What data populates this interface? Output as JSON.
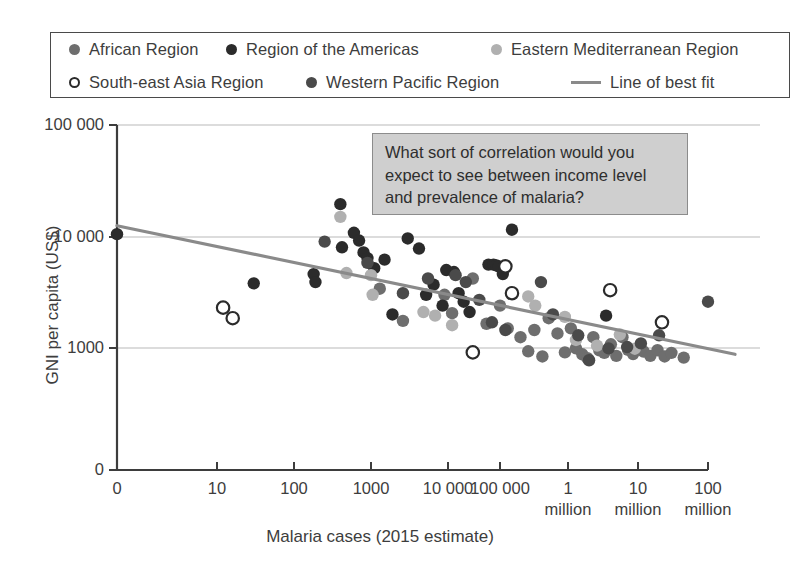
{
  "legend": {
    "entries": [
      {
        "label": "African Region",
        "marker": "filled-circle",
        "color": "#6e6e6e",
        "row": 0
      },
      {
        "label": "Region of the Americas",
        "marker": "filled-circle",
        "color": "#2b2b2b",
        "row": 0
      },
      {
        "label": "Eastern Mediterranean Region",
        "marker": "filled-circle",
        "color": "#b0b0b0",
        "row": 0
      },
      {
        "label": "South-east Asia Region",
        "marker": "hollow-circle",
        "color": "#ffffff",
        "row": 1
      },
      {
        "label": "Western Pacific Region",
        "marker": "filled-circle",
        "color": "#4a4a4a",
        "row": 1
      },
      {
        "label": "Line of best fit",
        "marker": "line",
        "color": "#8a8a8a",
        "row": 1
      }
    ]
  },
  "annotation": {
    "text": "What sort of correlation would you expect to see between income level and prevalence of malaria?",
    "background_color": "#cfcfcf",
    "border_color": "#8c8c8c"
  },
  "chart_data": {
    "type": "scatter",
    "title": "",
    "xlabel": "Malaria cases (2015 estimate)",
    "ylabel": "GNI per capita (US$)",
    "grid": true,
    "legend_position": "top",
    "x_tick_labels": [
      "0",
      "10",
      "100",
      "1000",
      "10 000",
      "100 000",
      "1\nmillion",
      "10\nmillion",
      "100\nmillion"
    ],
    "x_tick_values": [
      0,
      10,
      100,
      1000,
      10000,
      100000,
      1000000,
      10000000,
      100000000
    ],
    "y_tick_labels": [
      "0",
      "1000",
      "10 000",
      "100 000"
    ],
    "y_tick_values": [
      0,
      1000,
      10000,
      100000
    ],
    "y_scale": "log-with-zero-break",
    "x_scale": "log-with-zero-break",
    "best_fit_line": {
      "label": "Line of best fit",
      "color": "#8a8a8a",
      "x_start": 0,
      "y_start": 12500,
      "x_end": 100000000,
      "y_end": 700
    },
    "series": [
      {
        "name": "African Region",
        "color": "#6e6e6e",
        "points": [
          [
            1300,
            3400
          ],
          [
            2600,
            1750
          ],
          [
            9000,
            3000
          ],
          [
            12000,
            2050
          ],
          [
            30000,
            4200
          ],
          [
            55000,
            1650
          ],
          [
            100000,
            2400
          ],
          [
            130000,
            1500
          ],
          [
            200000,
            1250
          ],
          [
            260000,
            830
          ],
          [
            320000,
            1450
          ],
          [
            420000,
            620
          ],
          [
            520000,
            1850
          ],
          [
            700000,
            1350
          ],
          [
            900000,
            780
          ],
          [
            1100000,
            1500
          ],
          [
            1300000,
            980
          ],
          [
            1600000,
            700
          ],
          [
            1900000,
            560
          ],
          [
            2300000,
            1250
          ],
          [
            2800000,
            880
          ],
          [
            3300000,
            760
          ],
          [
            4100000,
            1080
          ],
          [
            4900000,
            640
          ],
          [
            6000000,
            1250
          ],
          [
            7200000,
            900
          ],
          [
            8500000,
            710
          ],
          [
            10000000,
            1000
          ],
          [
            12000000,
            820
          ],
          [
            15000000,
            640
          ],
          [
            19000000,
            880
          ],
          [
            24000000,
            620
          ],
          [
            30000000,
            760
          ],
          [
            45000000,
            580
          ]
        ]
      },
      {
        "name": "Region of the Americas",
        "color": "#2b2b2b",
        "points": [
          [
            0,
            10500
          ],
          [
            30,
            3800
          ],
          [
            180,
            4600
          ],
          [
            190,
            3900
          ],
          [
            400,
            19500
          ],
          [
            420,
            8000
          ],
          [
            600,
            10800
          ],
          [
            700,
            9200
          ],
          [
            800,
            7200
          ],
          [
            900,
            6400
          ],
          [
            1100,
            5200
          ],
          [
            1500,
            6200
          ],
          [
            1900,
            2000
          ],
          [
            3000,
            9600
          ],
          [
            4200,
            7800
          ],
          [
            5200,
            3000
          ],
          [
            6500,
            3700
          ],
          [
            8500,
            2400
          ],
          [
            9500,
            5000
          ],
          [
            13000,
            4800
          ],
          [
            16000,
            3100
          ],
          [
            20000,
            2600
          ],
          [
            26000,
            2100
          ],
          [
            60000,
            5600
          ],
          [
            75000,
            5600
          ],
          [
            85000,
            5500
          ],
          [
            95000,
            5400
          ],
          [
            110000,
            4600
          ],
          [
            150000,
            11500
          ],
          [
            3500000,
            1950
          ]
        ]
      },
      {
        "name": "Eastern Mediterranean Region",
        "color": "#b0b0b0",
        "points": [
          [
            400,
            15000
          ],
          [
            480,
            4700
          ],
          [
            1000,
            4500
          ],
          [
            1050,
            3000
          ],
          [
            4800,
            2100
          ],
          [
            6800,
            1950
          ],
          [
            12000,
            1600
          ],
          [
            260000,
            2900
          ],
          [
            330000,
            2400
          ],
          [
            900000,
            1900
          ],
          [
            1300000,
            1180
          ],
          [
            2600000,
            1050
          ],
          [
            5500000,
            1320
          ],
          [
            9000000,
            960
          ]
        ]
      },
      {
        "name": "South-east Asia Region",
        "color": "#ffffff",
        "points": [
          [
            12,
            2300
          ],
          [
            16,
            1850
          ],
          [
            30000,
            780
          ],
          [
            120000,
            5400
          ],
          [
            150000,
            3100
          ],
          [
            4000000,
            3300
          ],
          [
            22000000,
            1700
          ]
        ]
      },
      {
        "name": "Western Pacific Region",
        "color": "#4a4a4a",
        "points": [
          [
            250,
            9000
          ],
          [
            900,
            5800
          ],
          [
            2600,
            3100
          ],
          [
            5500,
            4200
          ],
          [
            14000,
            4500
          ],
          [
            22000,
            3900
          ],
          [
            40000,
            2700
          ],
          [
            70000,
            1700
          ],
          [
            120000,
            1450
          ],
          [
            400000,
            3900
          ],
          [
            600000,
            2000
          ],
          [
            1400000,
            1300
          ],
          [
            2000000,
            500
          ],
          [
            3800000,
            980
          ],
          [
            7000000,
            1020
          ],
          [
            11000000,
            1100
          ],
          [
            20000000,
            1300
          ],
          [
            100000000,
            2600
          ]
        ]
      }
    ]
  }
}
